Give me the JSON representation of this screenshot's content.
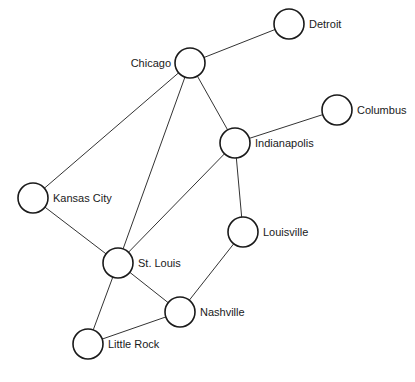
{
  "diagram": {
    "type": "undirected-graph",
    "node_radius": 15,
    "nodes": [
      {
        "id": "chicago",
        "label": "Chicago",
        "x": 190,
        "y": 63,
        "label_side": "left"
      },
      {
        "id": "detroit",
        "label": "Detroit",
        "x": 289,
        "y": 24,
        "label_side": "right"
      },
      {
        "id": "columbus",
        "label": "Columbus",
        "x": 337,
        "y": 110,
        "label_side": "right"
      },
      {
        "id": "indianapolis",
        "label": "Indianapolis",
        "x": 235,
        "y": 143,
        "label_side": "right"
      },
      {
        "id": "kansas-city",
        "label": "Kansas City",
        "x": 33,
        "y": 198,
        "label_side": "right"
      },
      {
        "id": "louisville",
        "label": "Louisville",
        "x": 243,
        "y": 232,
        "label_side": "right"
      },
      {
        "id": "st-louis",
        "label": "St. Louis",
        "x": 118,
        "y": 263,
        "label_side": "right"
      },
      {
        "id": "nashville",
        "label": "Nashville",
        "x": 180,
        "y": 312,
        "label_side": "right"
      },
      {
        "id": "little-rock",
        "label": "Little Rock",
        "x": 88,
        "y": 344,
        "label_side": "right"
      }
    ],
    "edges": [
      [
        "chicago",
        "detroit"
      ],
      [
        "chicago",
        "kansas-city"
      ],
      [
        "chicago",
        "st-louis"
      ],
      [
        "chicago",
        "indianapolis"
      ],
      [
        "indianapolis",
        "columbus"
      ],
      [
        "indianapolis",
        "st-louis"
      ],
      [
        "indianapolis",
        "louisville"
      ],
      [
        "kansas-city",
        "st-louis"
      ],
      [
        "louisville",
        "nashville"
      ],
      [
        "st-louis",
        "nashville"
      ],
      [
        "st-louis",
        "little-rock"
      ],
      [
        "nashville",
        "little-rock"
      ]
    ]
  }
}
